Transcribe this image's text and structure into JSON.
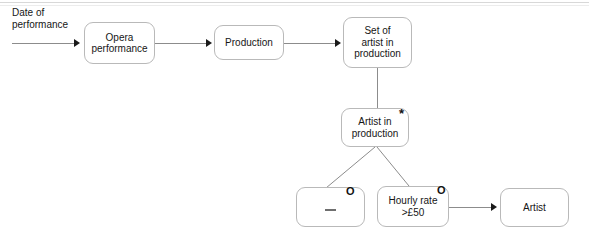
{
  "diagram": {
    "nodes": [
      {
        "id": "opera_performance",
        "label": "Opera\nperformance"
      },
      {
        "id": "production",
        "label": "Production"
      },
      {
        "id": "set_of_artist_in_production",
        "label": "Set of\nartist in\nproduction"
      },
      {
        "id": "artist_in_production",
        "label": "Artist in\nproduction"
      },
      {
        "id": "empty_condition",
        "label": ""
      },
      {
        "id": "hourly_rate",
        "label": "Hourly rate\n>£50"
      },
      {
        "id": "artist",
        "label": "Artist"
      }
    ],
    "labels": {
      "input_label": "Date of\nperformance"
    },
    "markers": {
      "star": "*",
      "circle": "O"
    },
    "colors": {
      "box_border": "#b9b9b9",
      "connector": "#8c8c8c",
      "arrowhead": "#1a1a1a",
      "text": "#161616",
      "background": "#ffffff"
    }
  }
}
